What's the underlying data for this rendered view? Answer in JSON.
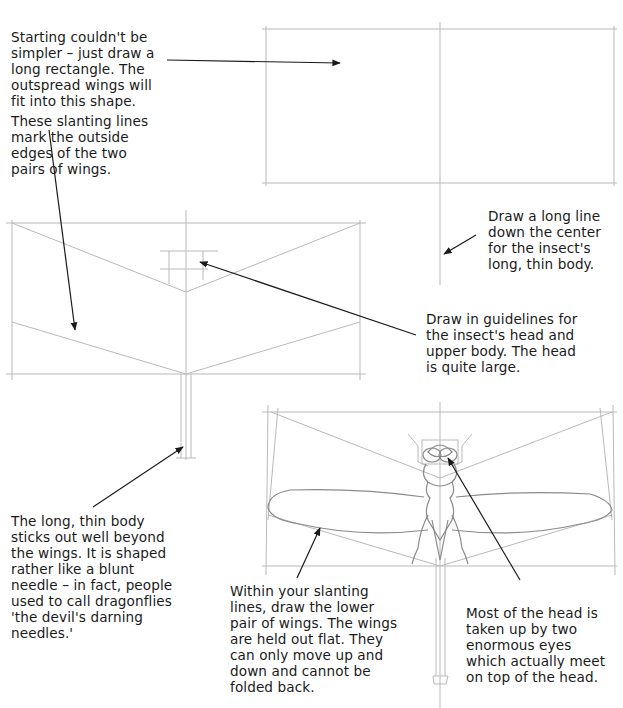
{
  "page": {
    "top_cut_text": "...g ... g ... y ... g",
    "captions": {
      "step1_rectangle": "Starting couldn't be\nsimpler – just draw a\nlong rectangle. The\noutspread wings will\nfit into this shape.",
      "step2_slanting_lines": "These slanting lines\nmark the outside\nedges of the two\npairs of wings.",
      "step1_center_line": "Draw a long line\ndown the center\nfor the insect's\nlong, thin body.",
      "step2_head_guidelines": "Draw in guidelines for\nthe insect's head and\nupper body. The head\nis quite large.",
      "step2_body": "The long, thin body\nsticks out well beyond\nthe wings. It is shaped\nrather like a blunt\nneedle – in fact, people\nused to call dragonflies\n'the devil's darning\nneedles.'",
      "step3_wings": "Within your slanting\nlines, draw the lower\npair of wings. The wings\nare held out flat. They\ncan only move up and\ndown and cannot be\nfolded back.",
      "step3_eyes": "Most of the head is\ntaken up by two\nenormous eyes\nwhich actually meet\non top of the head."
    },
    "colors": {
      "pencil": "#b8b8b8",
      "ink": "#1a1a1a",
      "background": "#ffffff"
    }
  }
}
